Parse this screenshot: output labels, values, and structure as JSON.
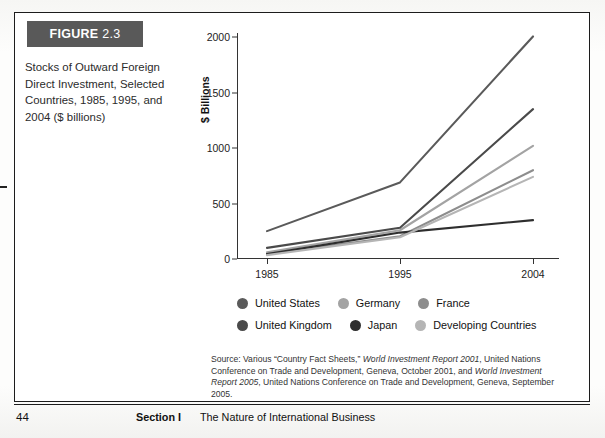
{
  "figure": {
    "badge_label": "FIGURE",
    "badge_number": "2.3",
    "caption": "Stocks of Outward Foreign Direct Investment, Selected Countries, 1985, 1995, and 2004 ($ billions)"
  },
  "chart_data": {
    "type": "line",
    "title": "",
    "xlabel": "",
    "ylabel": "$ Billions",
    "categories": [
      "1985",
      "1995",
      "2004"
    ],
    "x_tick_labels": [
      "1985",
      "1995",
      "2004"
    ],
    "y_tick_labels": [
      "0",
      "500",
      "1000",
      "1500",
      "2000"
    ],
    "y_ticks": [
      0,
      500,
      1000,
      1500,
      2000
    ],
    "ylim": [
      0,
      2000
    ],
    "grid": false,
    "legend_position": "bottom",
    "series": [
      {
        "name": "United States",
        "values": [
          251,
          690,
          2005
        ],
        "color": "#5a5a5a"
      },
      {
        "name": "Germany",
        "values": [
          60,
          259,
          1020
        ],
        "color": "#a3a3a3"
      },
      {
        "name": "France",
        "values": [
          44,
          205,
          800
        ],
        "color": "#8d8d8d"
      },
      {
        "name": "United Kingdom",
        "values": [
          100,
          281,
          1350
        ],
        "color": "#4a4a4a"
      },
      {
        "name": "Japan",
        "values": [
          44,
          238,
          350
        ],
        "color": "#2e2e2e"
      },
      {
        "name": "Developing Countries",
        "values": [
          35,
          196,
          740
        ],
        "color": "#b5b5b5"
      }
    ]
  },
  "legend": {
    "rows": [
      [
        {
          "label": "United States",
          "color": "#5a5a5a"
        },
        {
          "label": "Germany",
          "color": "#a3a3a3"
        },
        {
          "label": "France",
          "color": "#8d8d8d"
        }
      ],
      [
        {
          "label": "United Kingdom",
          "color": "#4a4a4a"
        },
        {
          "label": "Japan",
          "color": "#2e2e2e"
        },
        {
          "label": "Developing Countries",
          "color": "#b5b5b5"
        }
      ]
    ]
  },
  "source": {
    "line1_a": "Source: Various “Country Fact Sheets,” ",
    "line1_i": "World Investment Report 2001",
    "line1_b": ", United Nations Conference on Trade and Development, Geneva, October 2001, and ",
    "line2_i": "World Investment Report 2005",
    "line2_b": ", United Nations Conference on Trade and Development, Geneva, September 2005."
  },
  "footer": {
    "page_number": "44",
    "section": "Section I",
    "section_title": "The Nature of International Business"
  }
}
